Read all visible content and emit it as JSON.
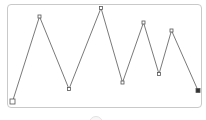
{
  "canvas": {
    "stroke_color": "#7a7a7a",
    "border_color": "#c9c9c9",
    "marker_color": "#555555"
  },
  "polyline": {
    "points": [
      {
        "x": 12.5,
        "y": 101.5,
        "role": "start"
      },
      {
        "x": 39.5,
        "y": 16.5
      },
      {
        "x": 69,
        "y": 89
      },
      {
        "x": 101,
        "y": 8
      },
      {
        "x": 122.5,
        "y": 82.5
      },
      {
        "x": 143.5,
        "y": 22.5
      },
      {
        "x": 159,
        "y": 74
      },
      {
        "x": 171.5,
        "y": 30.5
      },
      {
        "x": 198,
        "y": 90.5,
        "role": "end"
      }
    ]
  },
  "controls": {
    "bottom_button": "circle-button"
  }
}
